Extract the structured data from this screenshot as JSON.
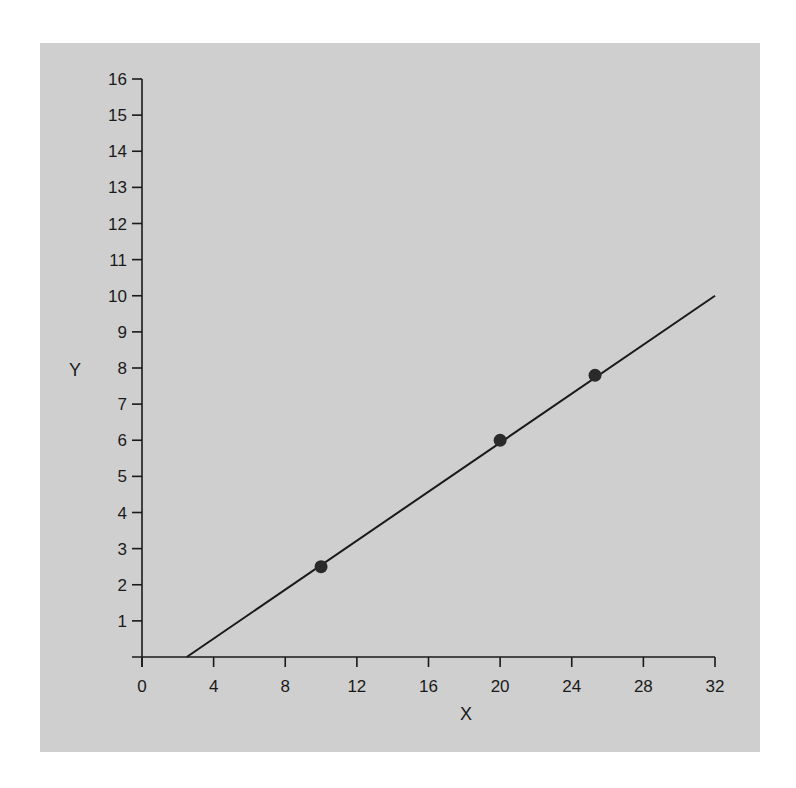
{
  "chart_data": {
    "type": "line",
    "title": "",
    "xlabel": "X",
    "ylabel": "Y",
    "xlim": [
      0,
      32
    ],
    "ylim": [
      0,
      16
    ],
    "x_ticks": [
      0,
      4,
      8,
      12,
      16,
      20,
      24,
      28,
      32
    ],
    "y_ticks": [
      1,
      2,
      3,
      4,
      5,
      6,
      7,
      8,
      9,
      10,
      11,
      12,
      13,
      14,
      15,
      16
    ],
    "grid": false,
    "legend": null,
    "series": [
      {
        "name": "line",
        "type": "line",
        "x": [
          2.5,
          32
        ],
        "y": [
          0,
          10
        ]
      },
      {
        "name": "points",
        "type": "scatter",
        "x": [
          10,
          20,
          25.3
        ],
        "y": [
          2.5,
          6,
          7.8
        ]
      }
    ],
    "colors": {
      "background": "#cfcfcf",
      "axis": "#1a1a1a",
      "line": "#1a1a1a",
      "points": "#2a2a2a"
    }
  }
}
